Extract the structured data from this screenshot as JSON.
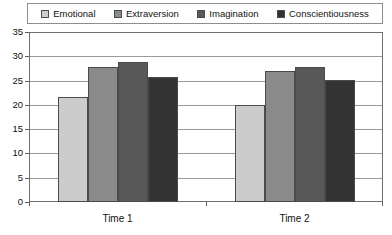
{
  "chart_data": {
    "type": "bar",
    "title": "",
    "subtitle": "",
    "xlabel": "",
    "ylabel": "",
    "categories": [
      "Time 1",
      "Time 2"
    ],
    "series": [
      {
        "name": "Emotional",
        "values": [
          21.7,
          20.0
        ],
        "color": "#cccccc"
      },
      {
        "name": "Extraversion",
        "values": [
          27.9,
          26.9
        ],
        "color": "#8a8a8a"
      },
      {
        "name": "Imagination",
        "values": [
          28.8,
          27.7
        ],
        "color": "#585858"
      },
      {
        "name": "Conscientiousness",
        "values": [
          25.7,
          25.1
        ],
        "color": "#333333"
      }
    ],
    "ylim": [
      0,
      35
    ],
    "yticks": [
      0,
      5,
      10,
      15,
      20,
      25,
      30,
      35
    ],
    "ytick_labels": [
      "0",
      "5",
      "10",
      "15",
      "20",
      "25",
      "30",
      "35"
    ],
    "grid": true,
    "legend_position": "top"
  },
  "legend": {
    "items": [
      {
        "label": "Emotional"
      },
      {
        "label": "Extraversion"
      },
      {
        "label": "Imagination"
      },
      {
        "label": "Conscientiousness"
      }
    ]
  }
}
